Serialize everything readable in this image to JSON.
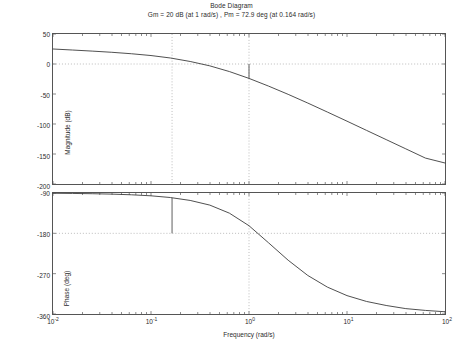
{
  "figure": {
    "title": "Bode Diagram",
    "subtitle": "Gm = 20 dB (at 1 rad/s) ,  Pm = 72.9 deg (at 0.164 rad/s)"
  },
  "axis": {
    "xlabel": "Frequency  (rad/s)",
    "mag_ylabel": "Magnitude (dB)",
    "phase_ylabel": "Phase (deg)",
    "xticks": [
      {
        "value": -2,
        "mantissa": "10",
        "exponent": "-2"
      },
      {
        "value": -1,
        "mantissa": "10",
        "exponent": "-1"
      },
      {
        "value": 0,
        "mantissa": "10",
        "exponent": "0"
      },
      {
        "value": 1,
        "mantissa": "10",
        "exponent": "1"
      },
      {
        "value": 2,
        "mantissa": "10",
        "exponent": "2"
      }
    ],
    "mag_yticks": [
      "50",
      "0",
      "-50",
      "-100",
      "-150",
      "-200"
    ],
    "phase_yticks": [
      "-90",
      "-180",
      "-270",
      "-360"
    ]
  },
  "margins": {
    "gain_margin_db": 20,
    "gain_margin_freq": 1,
    "phase_margin_deg": 72.9,
    "phase_margin_freq": 0.164
  },
  "style": {
    "curve_color": "#3a3a3a",
    "axis_color": "#555555",
    "grid_color": "#aaaaaa",
    "marker_color": "#4a4a4a",
    "background": "#ffffff"
  },
  "chart_data": [
    {
      "type": "line",
      "name": "magnitude",
      "title": "Bode Diagram",
      "xlabel": "Frequency  (rad/s)",
      "ylabel": "Magnitude (dB)",
      "xscale": "log",
      "xlim": [
        0.01,
        100
      ],
      "ylim": [
        -200,
        50
      ],
      "grid": true,
      "gridlines_y": [
        0
      ],
      "x": [
        0.01,
        0.0158,
        0.0251,
        0.0398,
        0.0631,
        0.1,
        0.158,
        0.164,
        0.251,
        0.398,
        0.631,
        1.0,
        1.58,
        2.51,
        3.98,
        6.31,
        10.0,
        15.8,
        25.1,
        39.8,
        63.1,
        100.0
      ],
      "y": [
        25.0,
        23.3,
        21.5,
        19.5,
        17.1,
        14.1,
        10.0,
        9.5,
        4.2,
        -3.1,
        -12.6,
        -24.0,
        -36.8,
        -50.6,
        -65.1,
        -80.1,
        -95.3,
        -110.6,
        -126.0,
        -141.4,
        -156.8,
        -165.0
      ],
      "annotations": [
        {
          "type": "gain-margin-marker",
          "x": 1.0,
          "y_from": 0,
          "y_to": -24.0,
          "label": "Gm = 20 dB (at 1 rad/s)"
        }
      ]
    },
    {
      "type": "line",
      "name": "phase",
      "xlabel": "Frequency  (rad/s)",
      "ylabel": "Phase (deg)",
      "xscale": "log",
      "xlim": [
        0.01,
        100
      ],
      "ylim": [
        -360,
        -90
      ],
      "grid": true,
      "gridlines_y": [
        -180
      ],
      "x": [
        0.01,
        0.0158,
        0.0251,
        0.0398,
        0.0631,
        0.1,
        0.158,
        0.164,
        0.251,
        0.398,
        0.631,
        1.0,
        1.58,
        2.51,
        3.98,
        6.31,
        10.0,
        15.8,
        25.1,
        39.8,
        63.1,
        100.0
      ],
      "y": [
        -90.6,
        -91.0,
        -91.6,
        -92.5,
        -94.0,
        -96.3,
        -100.1,
        -100.7,
        -106.6,
        -117.0,
        -135.0,
        -163.0,
        -201.0,
        -240.0,
        -274.0,
        -300.0,
        -319.0,
        -332.0,
        -341.0,
        -348.0,
        -352.0,
        -355.0
      ],
      "annotations": [
        {
          "type": "phase-margin-marker",
          "x": 0.164,
          "y_from": -100.7,
          "y_to": -180,
          "label": "Pm = 72.9 deg (at 0.164 rad/s)"
        }
      ]
    }
  ]
}
